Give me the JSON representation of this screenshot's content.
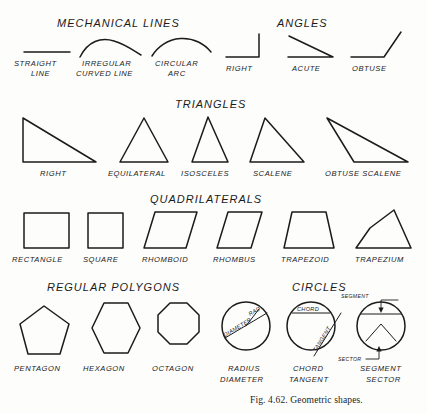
{
  "figure": {
    "caption": "Fig. 4.62.  Geometric shapes.",
    "background_color": "#fdfdfc",
    "ink_color": "#1b1b1b"
  },
  "sections": [
    {
      "id": "mechanical-lines",
      "heading": "MECHANICAL  LINES",
      "items": [
        {
          "name": "straight-line",
          "label_line1": "STRAIGHT",
          "label_line2": "LINE"
        },
        {
          "name": "irregular-curved-line",
          "label_line1": "IRREGULAR",
          "label_line2": "CURVED LINE"
        },
        {
          "name": "circular-arc",
          "label_line1": "CIRCULAR",
          "label_line2": "ARC"
        }
      ]
    },
    {
      "id": "angles",
      "heading": "ANGLES",
      "items": [
        {
          "name": "right-angle",
          "label_line1": "RIGHT",
          "label_line2": ""
        },
        {
          "name": "acute-angle",
          "label_line1": "ACUTE",
          "label_line2": ""
        },
        {
          "name": "obtuse-angle",
          "label_line1": "OBTUSE",
          "label_line2": ""
        }
      ]
    },
    {
      "id": "triangles",
      "heading": "TRIANGLES",
      "items": [
        {
          "name": "right-triangle",
          "label_line1": "RIGHT",
          "label_line2": ""
        },
        {
          "name": "equilateral-triangle",
          "label_line1": "EQUILATERAL",
          "label_line2": ""
        },
        {
          "name": "isosceles-triangle",
          "label_line1": "ISOSCELES",
          "label_line2": ""
        },
        {
          "name": "scalene-triangle",
          "label_line1": "SCALENE",
          "label_line2": ""
        },
        {
          "name": "obtuse-scalene-triangle",
          "label_line1": "OBTUSE SCALENE",
          "label_line2": ""
        }
      ]
    },
    {
      "id": "quadrilaterals",
      "heading": "QUADRILATERALS",
      "items": [
        {
          "name": "rectangle",
          "label_line1": "RECTANGLE",
          "label_line2": ""
        },
        {
          "name": "square",
          "label_line1": "SQUARE",
          "label_line2": ""
        },
        {
          "name": "rhomboid",
          "label_line1": "RHOMBOID",
          "label_line2": ""
        },
        {
          "name": "rhombus",
          "label_line1": "RHOMBUS",
          "label_line2": ""
        },
        {
          "name": "trapezoid",
          "label_line1": "TRAPEZOID",
          "label_line2": ""
        },
        {
          "name": "trapezium",
          "label_line1": "TRAPEZIUM",
          "label_line2": ""
        }
      ]
    },
    {
      "id": "regular-polygons",
      "heading": "REGULAR POLYGONS",
      "items": [
        {
          "name": "pentagon",
          "label_line1": "PENTAGON",
          "label_line2": ""
        },
        {
          "name": "hexagon",
          "label_line1": "HEXAGON",
          "label_line2": ""
        },
        {
          "name": "octagon",
          "label_line1": "OCTAGON",
          "label_line2": ""
        }
      ]
    },
    {
      "id": "circles",
      "heading": "CIRCLES",
      "items": [
        {
          "name": "radius-diameter-circle",
          "label_line1": "RADIUS",
          "label_line2": "DIAMETER"
        },
        {
          "name": "chord-tangent-circle",
          "label_line1": "CHORD",
          "label_line2": "TANGENT"
        },
        {
          "name": "segment-sector-circle",
          "label_line1": "SEGMENT",
          "label_line2": "SECTOR"
        }
      ]
    }
  ],
  "annotations": {
    "radius_inner": "RAD.",
    "diameter_inner": "DIAMETER",
    "chord_inner": "CHORD",
    "tangent_inner": "TANGENT",
    "segment_callout": "SEGMENT",
    "sector_callout": "SECTOR"
  }
}
